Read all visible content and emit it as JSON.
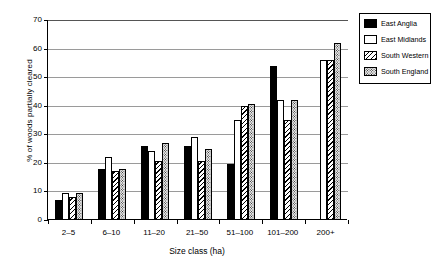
{
  "chart_data": {
    "type": "bar",
    "title": "",
    "xlabel": "Size class (ha)",
    "ylabel": "% of woods partially cleared",
    "categories": [
      "2–5",
      "6–10",
      "11–20",
      "21–50",
      "51–100",
      "101–200",
      "200+"
    ],
    "series": [
      {
        "name": "East Anglia",
        "values": [
          7,
          18,
          26,
          26,
          19.5,
          54,
          null
        ]
      },
      {
        "name": "East Midlands",
        "values": [
          9.5,
          22,
          24,
          29,
          35,
          42,
          56
        ]
      },
      {
        "name": "South Western",
        "values": [
          8,
          17,
          20.5,
          20.5,
          40,
          35,
          56
        ]
      },
      {
        "name": "South England",
        "values": [
          9.5,
          18,
          27,
          25,
          40.5,
          42,
          62
        ]
      }
    ],
    "ylim": [
      0,
      70
    ],
    "yticks": [
      0,
      10,
      20,
      30,
      40,
      50,
      60,
      70
    ],
    "ytick_labels": [
      "0",
      "10",
      "20",
      "30",
      "40",
      "50",
      "60",
      "70"
    ],
    "grid": true,
    "legend_position": "right-outside"
  },
  "legend": {
    "entries": [
      {
        "label": "East Anglia",
        "pattern": "solid-black"
      },
      {
        "label": "East Midlands",
        "pattern": "white-outline"
      },
      {
        "label": "South Western",
        "pattern": "diagonal-hatch"
      },
      {
        "label": "South England",
        "pattern": "dotted-stipple"
      }
    ]
  }
}
